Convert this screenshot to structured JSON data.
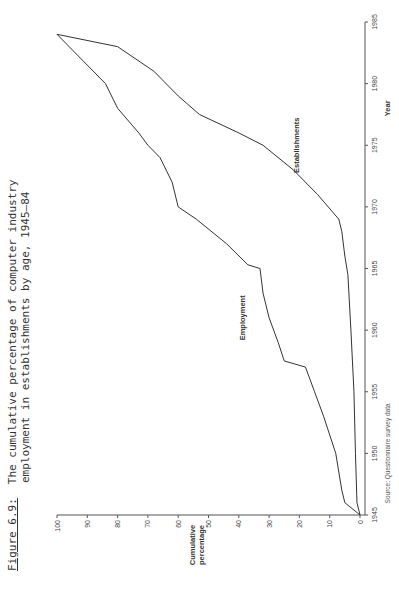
{
  "title": {
    "figure_label": "Figure 6.9:",
    "line1": "The cumulative percentage of computer industry",
    "line2": "employment in establishments by age, 1945–84"
  },
  "axes": {
    "x_label": "Year",
    "y_label_line1": "Cumulative",
    "y_label_line2": "percentage",
    "x_ticks": [
      "1945",
      "1950",
      "1955",
      "1960",
      "1965",
      "1970",
      "1975",
      "1980",
      "1985"
    ],
    "y_ticks": [
      "0",
      "10",
      "20",
      "30",
      "40",
      "50",
      "60",
      "70",
      "80",
      "90",
      "100"
    ]
  },
  "series_labels": {
    "employment": "Employment",
    "establishments": "Establishments"
  },
  "source": "Source: Questionnaire survey data",
  "chart_data": {
    "type": "line",
    "title": "The cumulative percentage of computer industry employment in establishments by age, 1945–84",
    "xlabel": "Year",
    "ylabel": "Cumulative percentage",
    "xlim": [
      1945,
      1985
    ],
    "ylim": [
      0,
      100
    ],
    "grid": false,
    "legend": "inline labels",
    "series": [
      {
        "name": "Employment",
        "x": [
          1945,
          1946,
          1947,
          1950,
          1953,
          1955,
          1957,
          1957.5,
          1959,
          1961,
          1963,
          1965,
          1965.3,
          1967,
          1969,
          1970,
          1972,
          1974,
          1975,
          1976,
          1978,
          1980,
          1982,
          1984
        ],
        "y": [
          0,
          5,
          6,
          8,
          12,
          15,
          18,
          25,
          27,
          30,
          32,
          33,
          37,
          44,
          54,
          60,
          62,
          66,
          70,
          73,
          80,
          84,
          92,
          100
        ]
      },
      {
        "name": "Establishments",
        "x": [
          1945,
          1946,
          1950,
          1955,
          1960,
          1964.5,
          1966,
          1968,
          1969,
          1971,
          1973,
          1975,
          1976,
          1977.5,
          1979,
          1981,
          1983,
          1984
        ],
        "y": [
          0,
          1,
          1.5,
          2,
          3,
          4,
          5,
          6,
          7,
          14,
          22,
          32,
          40,
          53,
          60,
          68,
          80,
          100
        ]
      }
    ]
  }
}
